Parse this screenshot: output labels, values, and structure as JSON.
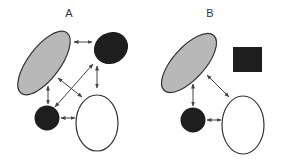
{
  "panels": [
    {
      "id": "A",
      "label": "A",
      "nodes": [
        {
          "id": "gray-ellipse",
          "shape": "ellipse",
          "fill": "#b8b8b8"
        },
        {
          "id": "black-ellipse",
          "shape": "ellipse",
          "fill": "#1e1e1e"
        },
        {
          "id": "black-circle",
          "shape": "circle",
          "fill": "#1e1e1e"
        },
        {
          "id": "white-ellipse",
          "shape": "ellipse",
          "fill": "#ffffff"
        }
      ],
      "edges": [
        {
          "from": "gray-ellipse",
          "to": "black-ellipse",
          "direction": "bidirectional"
        },
        {
          "from": "gray-ellipse",
          "to": "black-circle",
          "direction": "bidirectional"
        },
        {
          "from": "black-ellipse",
          "to": "white-ellipse",
          "direction": "bidirectional"
        },
        {
          "from": "black-circle",
          "to": "black-ellipse",
          "direction": "bidirectional"
        },
        {
          "from": "gray-ellipse",
          "to": "white-ellipse",
          "direction": "bidirectional"
        },
        {
          "from": "black-circle",
          "to": "white-ellipse",
          "direction": "bidirectional"
        }
      ]
    },
    {
      "id": "B",
      "label": "B",
      "nodes": [
        {
          "id": "gray-ellipse",
          "shape": "ellipse",
          "fill": "#b8b8b8"
        },
        {
          "id": "black-square",
          "shape": "square",
          "fill": "#1e1e1e"
        },
        {
          "id": "black-circle",
          "shape": "circle",
          "fill": "#1e1e1e"
        },
        {
          "id": "white-ellipse",
          "shape": "ellipse",
          "fill": "#ffffff"
        }
      ],
      "edges": [
        {
          "from": "gray-ellipse",
          "to": "black-circle",
          "direction": "bidirectional"
        },
        {
          "from": "gray-ellipse",
          "to": "white-ellipse",
          "direction": "bidirectional"
        },
        {
          "from": "black-circle",
          "to": "white-ellipse",
          "direction": "bidirectional"
        }
      ]
    }
  ],
  "colors": {
    "stroke": "#333333",
    "arrow": "#444444"
  }
}
